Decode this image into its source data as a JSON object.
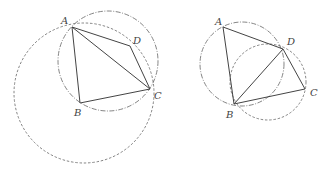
{
  "figures": [
    {
      "name": "left",
      "points": {
        "A": {
          "label": "A",
          "x": 72,
          "y": 27,
          "lx": 61,
          "ly": 24
        },
        "B": {
          "label": "B",
          "x": 80,
          "y": 103,
          "lx": 74,
          "ly": 116
        },
        "C": {
          "label": "C",
          "x": 150,
          "y": 89,
          "lx": 154,
          "ly": 99
        },
        "D": {
          "label": "D",
          "x": 130,
          "y": 46,
          "lx": 133,
          "ly": 44
        }
      },
      "segments": [
        [
          "A",
          "B"
        ],
        [
          "B",
          "C"
        ],
        [
          "C",
          "D"
        ],
        [
          "D",
          "A"
        ],
        [
          "A",
          "C"
        ]
      ],
      "circles": [
        {
          "style": "dash",
          "cx": 84,
          "cy": 93,
          "r": 70
        },
        {
          "style": "dashdot",
          "cx": 108,
          "cy": 61,
          "r": 50
        }
      ]
    },
    {
      "name": "right",
      "points": {
        "A": {
          "label": "A",
          "x": 223,
          "y": 27,
          "lx": 215,
          "ly": 25
        },
        "B": {
          "label": "B",
          "x": 234,
          "y": 104,
          "lx": 226,
          "ly": 118
        },
        "C": {
          "label": "C",
          "x": 305,
          "y": 89,
          "lx": 310,
          "ly": 96
        },
        "D": {
          "label": "D",
          "x": 283,
          "y": 49,
          "lx": 287,
          "ly": 45
        }
      },
      "segments": [
        [
          "A",
          "B"
        ],
        [
          "B",
          "C"
        ],
        [
          "C",
          "D"
        ],
        [
          "D",
          "A"
        ],
        [
          "B",
          "D"
        ]
      ],
      "circles": [
        {
          "style": "dashdot",
          "cx": 242,
          "cy": 64,
          "r": 42
        },
        {
          "style": "dash",
          "cx": 268,
          "cy": 82,
          "r": 38
        }
      ]
    }
  ]
}
